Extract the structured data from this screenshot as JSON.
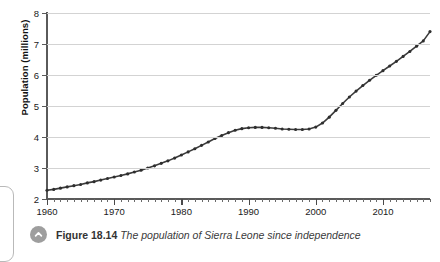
{
  "figure": {
    "number_label": "Figure 18.14",
    "title": "The population of Sierra Leone since independence",
    "icon": "circle-up-chevron-icon"
  },
  "colors": {
    "line": "#3b3b3b",
    "marker": "#2e2e2e",
    "grid": "#d3d3d3",
    "axis": "#5a5a5a",
    "caption_icon": "#9e9e9e",
    "background": "#ffffff"
  },
  "chart_data": {
    "type": "line",
    "title": "The population of Sierra Leone since independence",
    "xlabel": "",
    "ylabel": "Population (millions)",
    "xlim": [
      1960,
      2017
    ],
    "ylim": [
      2,
      8
    ],
    "grid": true,
    "legend": null,
    "x_tick_labels": [
      "1960",
      "1970",
      "1980",
      "1990",
      "2000",
      "2010"
    ],
    "x_tick_values": [
      1960,
      1970,
      1980,
      1990,
      2000,
      2010
    ],
    "x_minor_tick_interval": 1,
    "y_tick_labels": [
      "2",
      "3",
      "4",
      "5",
      "6",
      "7",
      "8"
    ],
    "y_tick_values": [
      2,
      3,
      4,
      5,
      6,
      7,
      8
    ],
    "series": [
      {
        "name": "Population of Sierra Leone",
        "x": [
          1960,
          1961,
          1962,
          1963,
          1964,
          1965,
          1966,
          1967,
          1968,
          1969,
          1970,
          1971,
          1972,
          1973,
          1974,
          1975,
          1976,
          1977,
          1978,
          1979,
          1980,
          1981,
          1982,
          1983,
          1984,
          1985,
          1986,
          1987,
          1988,
          1989,
          1990,
          1991,
          1992,
          1993,
          1994,
          1995,
          1996,
          1997,
          1998,
          1999,
          2000,
          2001,
          2002,
          2003,
          2004,
          2005,
          2006,
          2007,
          2008,
          2009,
          2010,
          2011,
          2012,
          2013,
          2014,
          2015,
          2016,
          2017
        ],
        "values": [
          2.28,
          2.31,
          2.35,
          2.39,
          2.43,
          2.47,
          2.52,
          2.56,
          2.61,
          2.66,
          2.71,
          2.76,
          2.81,
          2.87,
          2.93,
          3.0,
          3.07,
          3.15,
          3.23,
          3.32,
          3.42,
          3.52,
          3.62,
          3.73,
          3.84,
          3.95,
          4.05,
          4.14,
          4.22,
          4.27,
          4.3,
          4.31,
          4.31,
          4.3,
          4.28,
          4.26,
          4.25,
          4.24,
          4.24,
          4.26,
          4.32,
          4.45,
          4.64,
          4.86,
          5.08,
          5.29,
          5.48,
          5.66,
          5.83,
          5.99,
          6.14,
          6.29,
          6.44,
          6.6,
          6.76,
          6.93,
          7.1,
          7.4
        ]
      }
    ]
  }
}
